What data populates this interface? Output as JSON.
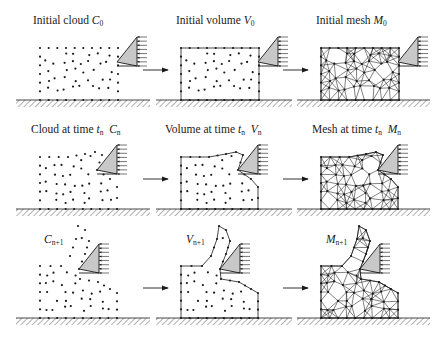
{
  "figure": {
    "colors": {
      "ink": "#1a1a1a",
      "tool_fill": "#c8c8c8",
      "background": "#ffffff"
    },
    "rows": [
      {
        "panels": [
          {
            "id": "initial-cloud",
            "text": "Initial cloud ",
            "sym": "C",
            "sub": "0"
          },
          {
            "id": "initial-volume",
            "text": "Initial volume ",
            "sym": "V",
            "sub": "0"
          },
          {
            "id": "initial-mesh",
            "text": "Initial mesh ",
            "sym": "M",
            "sub": "0"
          }
        ]
      },
      {
        "panels": [
          {
            "id": "cloud-tn",
            "text": "Cloud at time ",
            "t": "t",
            "tsub": "n",
            "sym": "C",
            "sub": "n"
          },
          {
            "id": "volume-tn",
            "text": "Volume at time ",
            "t": "t",
            "tsub": "n",
            "sym": "V",
            "sub": "n"
          },
          {
            "id": "mesh-tn",
            "text": "Mesh at time ",
            "t": "t",
            "tsub": "n",
            "sym": "M",
            "sub": "n"
          }
        ]
      },
      {
        "panels": [
          {
            "id": "cloud-n1",
            "text": "",
            "sym": "C",
            "sub": "n+1"
          },
          {
            "id": "volume-n1",
            "text": "",
            "sym": "V",
            "sub": "n+1"
          },
          {
            "id": "mesh-n1",
            "text": "",
            "sym": "M",
            "sub": "n+1"
          }
        ]
      }
    ],
    "arrows": [
      "cloud-to-volume",
      "volume-to-mesh"
    ]
  }
}
